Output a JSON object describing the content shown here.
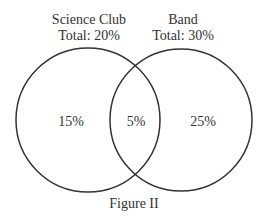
{
  "diagram": {
    "type": "venn",
    "sets": [
      {
        "name": "Science Club",
        "total_label": "Total: 20%"
      },
      {
        "name": "Band",
        "total_label": "Total: 30%"
      }
    ],
    "regions": {
      "science_only": "15%",
      "both": "5%",
      "band_only": "25%"
    },
    "caption": "Figure II",
    "stroke_color": "#333333"
  }
}
